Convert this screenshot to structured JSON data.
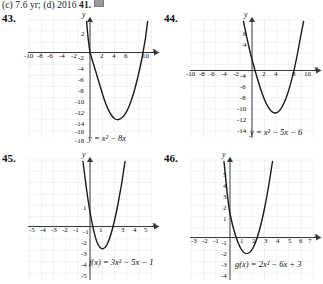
{
  "header": {
    "text_before": "(c) 7.6 yr; (d) 2016",
    "next_number": "41.",
    "icon": "media-icon"
  },
  "problems": [
    {
      "number": "43.",
      "equation": "y = x² − 8x",
      "equation_parts": {
        "lhs": "y",
        "a": "1",
        "b": "-8",
        "c": "0"
      },
      "axis": {
        "x_label": "x",
        "y_label": "y",
        "x_ticks": [
          "-10",
          "-8",
          "-6",
          "-4",
          "-2",
          "2",
          "4",
          "6",
          "10"
        ],
        "y_ticks": [
          "2",
          "-2",
          "-4",
          "-6",
          "-8",
          "-10",
          "-12",
          "-14",
          "-16",
          "-18"
        ]
      }
    },
    {
      "number": "44.",
      "equation": "y = x² − 5x − 6",
      "equation_parts": {
        "lhs": "y",
        "a": "1",
        "b": "-5",
        "c": "-6"
      },
      "axis": {
        "x_label": "x",
        "y_label": "y",
        "x_ticks": [
          "-10",
          "-8",
          "-6",
          "-4",
          "-2",
          "2",
          "4",
          "8",
          "10"
        ],
        "y_ticks": [
          "6",
          "4",
          "-4",
          "-6",
          "-8",
          "-10",
          "-12",
          "-14"
        ]
      }
    },
    {
      "number": "45.",
      "equation": "f(x) = 3x² − 5x − 1",
      "equation_parts": {
        "lhs": "f(x)",
        "a": "3",
        "b": "-5",
        "c": "-1"
      },
      "axis": {
        "x_label": "x",
        "y_label": "y",
        "x_ticks": [
          "-5",
          "-4",
          "-3",
          "-2",
          "-1",
          "1",
          "3",
          "4",
          "5"
        ],
        "y_ticks": [
          "1",
          "-1",
          "-2",
          "-3",
          "-4",
          "-5"
        ]
      }
    },
    {
      "number": "46.",
      "equation": "g(x) = 2x² − 6x + 3",
      "equation_parts": {
        "lhs": "g(x)",
        "a": "2",
        "b": "-6",
        "c": "3"
      },
      "axis": {
        "x_label": "x",
        "y_label": "y",
        "x_ticks": [
          "-3",
          "-2",
          "-1",
          "1",
          "2",
          "3",
          "4",
          "5",
          "6",
          "7"
        ],
        "y_ticks": [
          "5",
          "4",
          "3",
          "2",
          "1",
          "-1",
          "-2",
          "-3",
          "-4"
        ]
      }
    }
  ],
  "colors": {
    "grid": "#d9dde0",
    "axis": "#3a3a3a",
    "curve": "#1a1a1a",
    "text": "#111111",
    "paper": "#ffffff"
  }
}
